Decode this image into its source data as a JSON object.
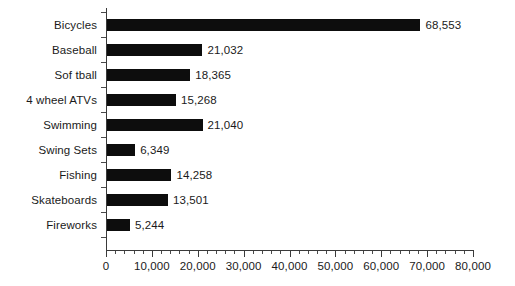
{
  "chart_data": {
    "type": "bar",
    "orientation": "horizontal",
    "title": "",
    "subtitle": "",
    "xlabel": "",
    "ylabel": "",
    "categories": [
      "Bicycles",
      "Baseball",
      "Sof tball",
      "4 wheel ATVs",
      "Swimming",
      "Swing Sets",
      "Fishing",
      "Skateboards",
      "Fireworks"
    ],
    "values": [
      68553,
      21032,
      18365,
      15268,
      21040,
      6349,
      14258,
      13501,
      5244
    ],
    "value_labels": [
      "68,553",
      "21,032",
      "18,365",
      "15,268",
      "21,040",
      "6,349",
      "14,258",
      "13,501",
      "5,244"
    ],
    "xlim": [
      0,
      80000
    ],
    "xticks": [
      0,
      10000,
      20000,
      30000,
      40000,
      50000,
      60000,
      70000,
      80000
    ],
    "xtick_labels": [
      "0",
      "10,000",
      "20,000",
      "30,000",
      "40,000",
      "50,000",
      "60,000",
      "70,000",
      "80,000"
    ],
    "x_minor_tick_interval": 2000,
    "grid": false,
    "legend": false,
    "legend_position": "none",
    "bar_color": "#0d0d0d",
    "background_color": "#ffffff",
    "axis_color": "#3a3a3a",
    "data_labels_shown": true
  }
}
